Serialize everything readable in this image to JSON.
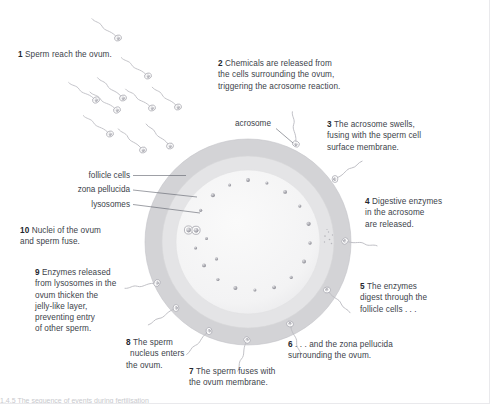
{
  "figure": {
    "background_color": "#ffffff",
    "text_color": "#3c3f4a",
    "partial_caption": "1.4.5  The sequence of events during fertilisation"
  },
  "ovum": {
    "center_x": 248,
    "center_y": 242,
    "follicle_layer": {
      "label": "follicle cells",
      "radius": 103,
      "color": "#d2d2d4"
    },
    "zona_layer": {
      "label": "zona pellucida",
      "radius": 86,
      "color": "#e2e2e4"
    },
    "cytoplasm": {
      "radius": 72,
      "color": "#f4f4f4"
    },
    "lysosomes": {
      "label": "lysosomes",
      "count": 20,
      "color": "#9a9aa0"
    },
    "fused_nuclei": {
      "label": "nuclei of ovum and sperm",
      "color": "#8e8e96"
    }
  },
  "callouts": [
    {
      "id": "follicle-cells",
      "label": "follicle cells"
    },
    {
      "id": "zona-pellucida",
      "label": "zona pellucida"
    },
    {
      "id": "lysosomes",
      "label": "lysosomes"
    },
    {
      "id": "acrosome",
      "label": "acrosome"
    }
  ],
  "steps": [
    {
      "number": "1",
      "text": "Sperm reach the ovum."
    },
    {
      "number": "2",
      "text": "Chemicals are released from the cells surrounding the ovum, triggering the acrosome reaction.",
      "lines": [
        "Chemicals are released from",
        "the cells surrounding the ovum,",
        "triggering the acrosome reaction."
      ]
    },
    {
      "number": "3",
      "text": "The acrosome swells, fusing with the sperm cell surface membrane.",
      "lines": [
        "The acrosome swells,",
        "fusing with the sperm cell",
        "surface membrane."
      ]
    },
    {
      "number": "4",
      "text": "Digestive enzymes in the acrosome are released.",
      "lines": [
        "Digestive enzymes",
        "in the acrosome",
        "are released."
      ]
    },
    {
      "number": "5",
      "text": "The enzymes digest through the follicle cells . . .",
      "lines": [
        "The enzymes",
        "digest through the",
        "follicle cells . . ."
      ]
    },
    {
      "number": "6",
      "text": ". . . and the zona pellucida surrounding the ovum.",
      "lines": [
        ". . . and the zona pellucida",
        "surrounding the ovum."
      ]
    },
    {
      "number": "7",
      "text": "The sperm fuses with the ovum membrane.",
      "lines": [
        "The sperm fuses with",
        "the ovum membrane."
      ]
    },
    {
      "number": "8",
      "text": "The sperm nucleus enters the ovum.",
      "lines": [
        "The sperm",
        "nucleus enters",
        "the ovum."
      ]
    },
    {
      "number": "9",
      "text": "Enzymes released from lysosomes in the ovum thicken the jelly-like layer, preventing entry of other sperm.",
      "lines": [
        "Enzymes released",
        "from lysosomes in the",
        "ovum thicken the",
        "jelly-like layer,",
        "preventing entry",
        "of other sperm."
      ]
    },
    {
      "number": "10",
      "text": "Nuclei of the ovum and sperm fuse.",
      "lines": [
        "Nuclei of the ovum",
        "and sperm fuse."
      ]
    }
  ],
  "sperm_swarm": {
    "description": "sperm cells swimming toward the ovum",
    "count": 13,
    "head_color": "#9c9ca4",
    "tail_color": "#b9b9bf"
  }
}
